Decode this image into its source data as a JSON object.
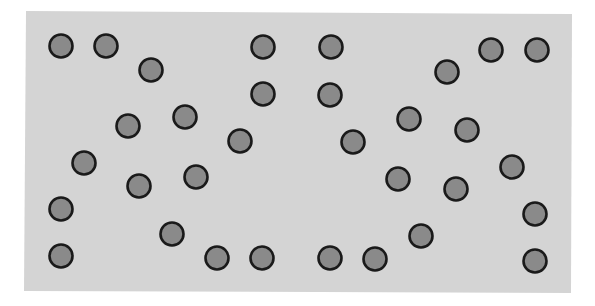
{
  "figure": {
    "panel": {
      "fill": "#d4d4d4",
      "points": [
        [
          26,
          11
        ],
        [
          572,
          14
        ],
        [
          571,
          293
        ],
        [
          24,
          291
        ]
      ]
    },
    "circle_style": {
      "radius": 11.5,
      "fill": "#8a8a8a",
      "stroke": "#1a1a1a",
      "stroke_width": 2.6
    },
    "circles": [
      {
        "cx": 61,
        "cy": 46
      },
      {
        "cx": 106,
        "cy": 46
      },
      {
        "cx": 151,
        "cy": 70
      },
      {
        "cx": 263,
        "cy": 47
      },
      {
        "cx": 331,
        "cy": 47
      },
      {
        "cx": 447,
        "cy": 72
      },
      {
        "cx": 491,
        "cy": 50
      },
      {
        "cx": 537,
        "cy": 50
      },
      {
        "cx": 263,
        "cy": 94
      },
      {
        "cx": 330,
        "cy": 95
      },
      {
        "cx": 128,
        "cy": 126
      },
      {
        "cx": 185,
        "cy": 117
      },
      {
        "cx": 240,
        "cy": 141
      },
      {
        "cx": 353,
        "cy": 142
      },
      {
        "cx": 409,
        "cy": 119
      },
      {
        "cx": 467,
        "cy": 130
      },
      {
        "cx": 84,
        "cy": 163
      },
      {
        "cx": 139,
        "cy": 186
      },
      {
        "cx": 196,
        "cy": 177
      },
      {
        "cx": 398,
        "cy": 179
      },
      {
        "cx": 456,
        "cy": 189
      },
      {
        "cx": 512,
        "cy": 167
      },
      {
        "cx": 61,
        "cy": 209
      },
      {
        "cx": 535,
        "cy": 214
      },
      {
        "cx": 172,
        "cy": 234
      },
      {
        "cx": 421,
        "cy": 236
      },
      {
        "cx": 61,
        "cy": 256
      },
      {
        "cx": 217,
        "cy": 258
      },
      {
        "cx": 262,
        "cy": 258
      },
      {
        "cx": 330,
        "cy": 258
      },
      {
        "cx": 375,
        "cy": 259
      },
      {
        "cx": 535,
        "cy": 261
      }
    ]
  }
}
